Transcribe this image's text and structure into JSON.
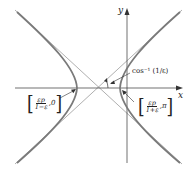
{
  "diagram": {
    "type": "hyperbola-polar",
    "axes": {
      "x_label": "x",
      "y_label": "y"
    },
    "annotations": {
      "angle_label": "cos⁻¹ (1/ε)",
      "left_vertex": {
        "numerator": "εp",
        "denominator": "1−ε",
        "angle": "0"
      },
      "right_vertex": {
        "numerator": "εp",
        "denominator": "1+ε",
        "angle": "π"
      }
    },
    "colors": {
      "curve": "#7a7a7a",
      "asymptote": "#9a9a9a",
      "axis": "#333333",
      "text": "#222222"
    }
  }
}
